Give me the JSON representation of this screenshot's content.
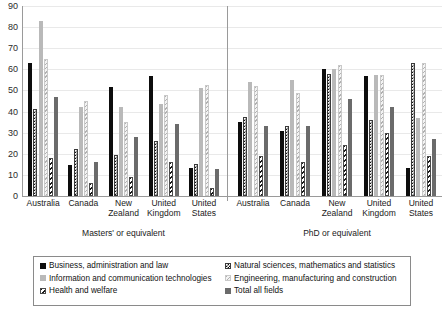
{
  "chart_data": {
    "type": "bar",
    "title": "",
    "subtitle": "",
    "xlabel": "",
    "ylabel": "",
    "ylim": [
      0,
      90
    ],
    "yticks": [
      0,
      10,
      20,
      30,
      40,
      50,
      60,
      70,
      80,
      90
    ],
    "grid": true,
    "legend_position": "bottom",
    "panels": [
      {
        "name": "Masters' or equivalent",
        "categories": [
          "Australia",
          "Canada",
          "New Zealand",
          "United Kingdom",
          "United States"
        ]
      },
      {
        "name": "PhD or equivalent",
        "categories": [
          "Australia",
          "Canada",
          "New Zealand",
          "United Kingdom",
          "United States"
        ]
      }
    ],
    "series": [
      {
        "name": "Business, administration and law",
        "key": "business",
        "style": "solid-black",
        "color": "#0d0d0d",
        "values": {
          "Masters' or equivalent": [
            63,
            14.5,
            51.5,
            57,
            13.5
          ],
          "PhD or equivalent": [
            35,
            31,
            60,
            57,
            13.5
          ]
        }
      },
      {
        "name": "Natural sciences, mathematics and statistics",
        "key": "natural_sciences",
        "style": "checkered",
        "color": "#111111",
        "values": {
          "Masters' or equivalent": [
            41,
            22.5,
            19.5,
            26,
            15
          ],
          "PhD or equivalent": [
            37.5,
            33,
            58,
            36,
            63
          ]
        }
      },
      {
        "name": "Information and communication technologies",
        "key": "ict",
        "style": "solid-light-grey",
        "color": "#b9b9b9",
        "values": {
          "Masters' or equivalent": [
            83,
            42,
            42,
            43.5,
            51
          ],
          "PhD or equivalent": [
            54,
            55,
            60,
            57.5,
            37
          ]
        }
      },
      {
        "name": "Engineering, manufacturing and construction",
        "key": "engineering",
        "style": "light-hatch",
        "color": "#e2e2e2",
        "values": {
          "Masters' or equivalent": [
            65,
            45,
            35,
            48,
            52.5
          ],
          "PhD or equivalent": [
            52,
            49,
            62,
            57.5,
            63
          ]
        }
      },
      {
        "name": "Health and welfare",
        "key": "health",
        "style": "dark-hatch",
        "color": "#1a1a1a",
        "values": {
          "Masters' or equivalent": [
            18,
            6,
            9,
            16,
            4
          ],
          "PhD or equivalent": [
            19,
            16,
            24,
            30,
            19
          ]
        }
      },
      {
        "name": "Total all fields",
        "key": "total",
        "style": "solid-mid-grey",
        "color": "#6b6b6b",
        "values": {
          "Masters' or equivalent": [
            47,
            16,
            28,
            34,
            13
          ],
          "PhD or equivalent": [
            33,
            33,
            46,
            42,
            27
          ]
        }
      }
    ]
  },
  "axis": {
    "y_tick_labels": [
      "90",
      "80",
      "70",
      "60",
      "50",
      "40",
      "30",
      "20",
      "10",
      "0"
    ]
  },
  "panel_labels": {
    "left": "Masters' or equivalent",
    "right": "PhD or equivalent"
  },
  "categories": {
    "left": [
      "Australia",
      "Canada",
      "New Zealand",
      "United Kingdom",
      "United States"
    ],
    "right": [
      "Australia",
      "Canada",
      "New Zealand",
      "United Kingdom",
      "United States"
    ]
  },
  "legend": {
    "column1": [
      "Business, administration and law",
      "Information and communication technologies",
      "Health and welfare"
    ],
    "column2": [
      "Natural sciences, mathematics and statistics",
      "Engineering, manufacturing and construction",
      "Total all fields"
    ]
  }
}
